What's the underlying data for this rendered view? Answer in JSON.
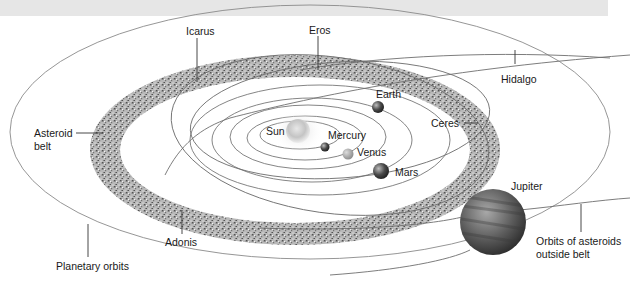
{
  "diagram": {
    "labels": {
      "icarus": "Icarus",
      "eros": "Eros",
      "hidalgo": "Hidalgo",
      "earth": "Earth",
      "ceres": "Ceres",
      "asteroid_belt_line1": "Asteroid",
      "asteroid_belt_line2": "belt",
      "sun": "Sun",
      "mercury": "Mercury",
      "venus": "Venus",
      "mars": "Mars",
      "jupiter": "Jupiter",
      "adonis": "Adonis",
      "planetary_orbits": "Planetary orbits",
      "outside_belt_line1": "Orbits of asteroids",
      "outside_belt_line2": "outside belt"
    },
    "colors": {
      "top_band": "#e6e6e6",
      "orbit_line": "#6e6e6e",
      "belt": "#8a8a8a",
      "label_text": "#1a1a1a"
    }
  }
}
